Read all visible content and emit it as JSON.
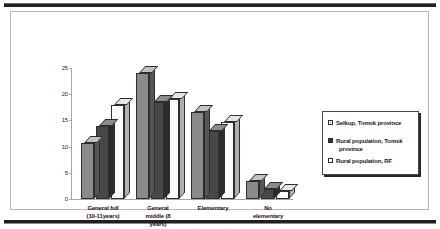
{
  "chart_data": {
    "type": "bar",
    "title": "",
    "xlabel": "",
    "ylabel": "",
    "ylim": [
      0,
      25
    ],
    "yticks": [
      0,
      5,
      10,
      15,
      20,
      25
    ],
    "grid": false,
    "legend_position": "right",
    "orientation": "vertical-3d-grouped",
    "categories": [
      "General full (10-11years)",
      "General middle (8 years)",
      "Elementary",
      "No elementary"
    ],
    "category_lines": [
      [
        "General full",
        "(10-11years)"
      ],
      [
        "General",
        "middle (8",
        "years)"
      ],
      [
        "Elementary"
      ],
      [
        "No",
        "elementary"
      ]
    ],
    "series": [
      {
        "name": "Selkup, Tomsk province",
        "values": [
          10.7,
          24,
          16.7,
          3.5
        ]
      },
      {
        "name": "Rural population, Tomsk province",
        "values": [
          14,
          18.5,
          13,
          2
        ]
      },
      {
        "name": "Rural population, RF",
        "values": [
          18,
          19,
          14.7,
          1.5
        ]
      }
    ]
  },
  "legend": {
    "entries": [
      {
        "label": "Selkup, Tomsk province",
        "line1": "Selkup, Tomsk province",
        "line2": ""
      },
      {
        "label": "Rural population, Tomsk province",
        "line1": "Rural population, Tomsk",
        "line2": "province"
      },
      {
        "label": "Rural population, RF",
        "line1": "Rural population, RF",
        "line2": ""
      }
    ]
  }
}
